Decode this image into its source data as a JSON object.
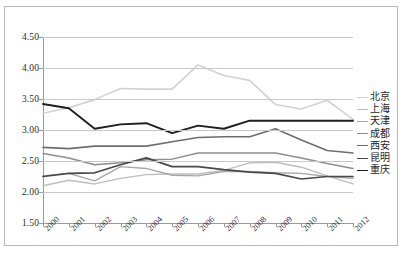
{
  "chart_data": {
    "type": "line",
    "title": "",
    "subtitle": "",
    "xlabel": "",
    "ylabel": "",
    "x": [
      2000,
      2001,
      2002,
      2003,
      2004,
      2005,
      2006,
      2007,
      2008,
      2009,
      2010,
      2011,
      2012
    ],
    "categories": [
      "2000",
      "2001",
      "2002",
      "2003",
      "2004",
      "2005",
      "2006",
      "2007",
      "2008",
      "2009",
      "2010",
      "2011",
      "2012"
    ],
    "ylim": [
      1.5,
      4.5
    ],
    "yticks": [
      "1.50",
      "2.00",
      "2.50",
      "3.00",
      "3.50",
      "4.00",
      "4.50"
    ],
    "ytick_values": [
      1.5,
      2.0,
      2.5,
      3.0,
      3.5,
      4.0,
      4.5
    ],
    "grid": true,
    "legend_position": "right",
    "series": [
      {
        "name": "北京",
        "color": "#d2d2d2",
        "width": 1.6,
        "values": [
          3.27,
          3.36,
          3.49,
          3.67,
          3.66,
          3.66,
          4.05,
          3.88,
          3.8,
          3.41,
          3.34,
          3.48,
          3.17
        ]
      },
      {
        "name": "上海",
        "color": "#bdbdbd",
        "width": 1.4,
        "values": [
          2.1,
          2.19,
          2.13,
          2.22,
          2.28,
          2.29,
          2.29,
          2.35,
          2.47,
          2.48,
          2.4,
          2.26,
          2.13
        ]
      },
      {
        "name": "天津",
        "color": "#a8a8a8",
        "width": 1.4,
        "values": [
          2.26,
          2.3,
          2.18,
          2.41,
          2.38,
          2.27,
          2.26,
          2.33,
          2.33,
          2.31,
          2.3,
          2.25,
          2.22
        ]
      },
      {
        "name": "成都",
        "color": "#8e8e8e",
        "width": 1.5,
        "values": [
          2.62,
          2.55,
          2.44,
          2.47,
          2.52,
          2.53,
          2.63,
          2.63,
          2.63,
          2.63,
          2.55,
          2.46,
          2.38
        ]
      },
      {
        "name": "西安",
        "color": "#6e6e6e",
        "width": 1.6,
        "values": [
          2.72,
          2.7,
          2.74,
          2.74,
          2.74,
          2.81,
          2.88,
          2.89,
          2.89,
          3.02,
          2.84,
          2.67,
          2.63
        ]
      },
      {
        "name": "昆明",
        "color": "#4a4a4a",
        "width": 1.7,
        "values": [
          2.25,
          2.3,
          2.31,
          2.44,
          2.55,
          2.41,
          2.41,
          2.36,
          2.32,
          2.3,
          2.21,
          2.25,
          2.25
        ]
      },
      {
        "name": "重庆",
        "color": "#1f1f1f",
        "width": 1.9,
        "values": [
          3.42,
          3.35,
          3.02,
          3.09,
          3.11,
          2.95,
          3.07,
          3.02,
          3.15,
          3.15,
          3.15,
          3.15,
          3.15
        ]
      }
    ]
  },
  "legend": {
    "items": [
      {
        "label": "北京"
      },
      {
        "label": "上海"
      },
      {
        "label": "天津"
      },
      {
        "label": "成都"
      },
      {
        "label": "西安"
      },
      {
        "label": "昆明"
      },
      {
        "label": "重庆"
      }
    ]
  }
}
